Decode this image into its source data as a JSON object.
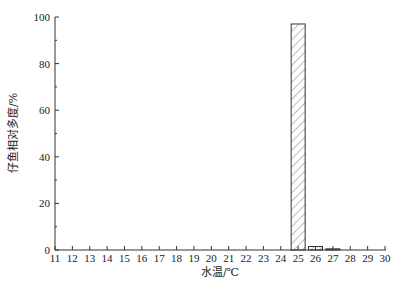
{
  "chart_data": {
    "type": "bar",
    "title": "",
    "xlabel": "水温/℃",
    "ylabel": "仔鱼相对多度/%",
    "categories": [
      "11",
      "12",
      "13",
      "14",
      "15",
      "16",
      "17",
      "18",
      "19",
      "20",
      "21",
      "22",
      "23",
      "24",
      "25",
      "26",
      "27",
      "28",
      "29",
      "30"
    ],
    "values": [
      0,
      0,
      0,
      0,
      0,
      0,
      0,
      0,
      0,
      0,
      0,
      0,
      0,
      0,
      97,
      1.5,
      0.5,
      0,
      0,
      0
    ],
    "ylim": [
      0,
      100
    ],
    "xlim": [
      11,
      30
    ],
    "yticks": [
      0,
      20,
      40,
      60,
      80,
      100
    ],
    "grid": false,
    "bar_fill": "hatched",
    "axis_color": "#333333"
  }
}
